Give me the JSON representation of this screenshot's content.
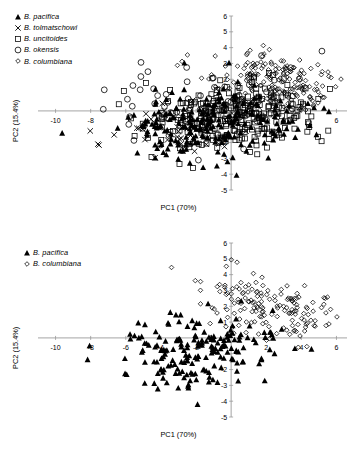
{
  "figure": {
    "panels": [
      {
        "id": "a",
        "legend": [
          {
            "marker": "filled-triangle",
            "label": "B. pacifica"
          },
          {
            "marker": "cross",
            "label": "B. tolmatschowi"
          },
          {
            "marker": "open-square",
            "label": "B. uncitoides"
          },
          {
            "marker": "open-circle",
            "label": "B. okensis"
          },
          {
            "marker": "open-diamond",
            "label": "B. columbiana"
          }
        ],
        "chart_data": {
          "type": "scatter",
          "title": "",
          "xlabel": "PC1 (70%)",
          "ylabel": "PC2 (15.4%)",
          "xlim": [
            -11,
            6.6
          ],
          "ylim": [
            -5,
            6
          ],
          "xticks": [
            -10,
            -8,
            -6,
            -4,
            -2,
            2,
            4,
            6
          ],
          "xticklabels": [
            "-10",
            "-8",
            "",
            "",
            "",
            "",
            "",
            "6"
          ],
          "yticks": [
            -5,
            -4,
            -3,
            -2,
            -1,
            1,
            2,
            3,
            4,
            5,
            6
          ],
          "yticklabels": [
            "-5",
            "-4",
            "-3",
            "-2",
            "",
            "",
            "2",
            "3",
            "4",
            "5",
            "6"
          ],
          "grid": false,
          "legend_position": "top-left",
          "axes_style": "crossed-at-origin",
          "series": [
            {
              "name": "B. pacifica",
              "marker": "filled-triangle",
              "n": 230,
              "cx": -1.0,
              "cy": -0.9,
              "sx": 2.5,
              "sy": 1.15,
              "rho": 0.1,
              "seed": 11
            },
            {
              "name": "B. tolmatschowi",
              "marker": "cross",
              "n": 46,
              "cx": -3.1,
              "cy": -1.2,
              "sx": 1.9,
              "sy": 0.95,
              "rho": 0.25,
              "seed": 23
            },
            {
              "name": "B. uncitoides",
              "marker": "open-square",
              "n": 250,
              "cx": 0.6,
              "cy": -0.35,
              "sx": 2.3,
              "sy": 1.05,
              "rho": 0.18,
              "seed": 37
            },
            {
              "name": "B. okensis",
              "marker": "open-circle",
              "n": 70,
              "cx": -1.4,
              "cy": 0.55,
              "sx": 3.1,
              "sy": 1.25,
              "rho": 0.12,
              "seed": 53
            },
            {
              "name": "B. columbiana",
              "marker": "open-diamond",
              "n": 190,
              "cx": 2.6,
              "cy": 1.85,
              "sx": 1.85,
              "sy": 0.95,
              "rho": -0.3,
              "seed": 71
            }
          ]
        }
      },
      {
        "id": "b",
        "legend": [
          {
            "marker": "filled-triangle",
            "label": "B. pacifica"
          },
          {
            "marker": "open-diamond",
            "label": "B. columbiana"
          }
        ],
        "chart_data": {
          "type": "scatter",
          "title": "",
          "xlabel": "PC1 (70%)",
          "ylabel": "PC2 (15.4%)",
          "xlim": [
            -11,
            6.6
          ],
          "ylim": [
            -5,
            6
          ],
          "xticks": [
            -10,
            -8,
            -6,
            -4,
            -2,
            2,
            4,
            6
          ],
          "xticklabels": [
            "-10",
            "-8",
            "-6",
            "-4",
            "-2",
            "2",
            "4",
            "6"
          ],
          "yticks": [
            -5,
            -4,
            -3,
            -2,
            -1,
            1,
            2,
            3,
            4,
            5,
            6
          ],
          "yticklabels": [
            "-5",
            "-4",
            "-3",
            "-2",
            "",
            "1",
            "2",
            "3",
            "4",
            "5",
            "6"
          ],
          "grid": false,
          "legend_position": "top-left",
          "axes_style": "crossed-at-origin",
          "series": [
            {
              "name": "B. pacifica",
              "marker": "filled-triangle",
              "n": 190,
              "cx": -1.6,
              "cy": -0.85,
              "sx": 2.4,
              "sy": 1.15,
              "rho": 0.1,
              "seed": 101
            },
            {
              "name": "B. columbiana",
              "marker": "open-diamond",
              "n": 165,
              "cx": 2.3,
              "cy": 1.95,
              "sx": 1.85,
              "sy": 0.95,
              "rho": -0.32,
              "seed": 137
            }
          ]
        }
      }
    ]
  },
  "colors": {
    "ink": "#000000",
    "axis": "#999999",
    "tick": "#000000"
  }
}
